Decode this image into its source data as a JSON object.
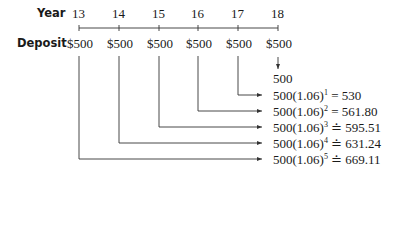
{
  "labels": {
    "year": "Year",
    "deposit": "Deposit"
  },
  "years": [
    "13",
    "14",
    "15",
    "16",
    "17",
    "18"
  ],
  "deposits": [
    "$500",
    "$500",
    "$500",
    "$500",
    "$500",
    "$500"
  ],
  "results": [
    {
      "base": "500",
      "exponent": "",
      "relation": "",
      "value": ""
    },
    {
      "base": "500(1.06)",
      "exponent": "1",
      "relation": "=",
      "value": "530"
    },
    {
      "base": "500(1.06)",
      "exponent": "2",
      "relation": "=",
      "value": "561.80"
    },
    {
      "base": "500(1.06)",
      "exponent": "3",
      "relation": "≐",
      "value": "595.51"
    },
    {
      "base": "500(1.06)",
      "exponent": "4",
      "relation": "≐",
      "value": "631.24"
    },
    {
      "base": "500(1.06)",
      "exponent": "5",
      "relation": "≐",
      "value": "669.11"
    }
  ],
  "colors": {
    "line": "#333333",
    "text": "#1a1a1a"
  }
}
